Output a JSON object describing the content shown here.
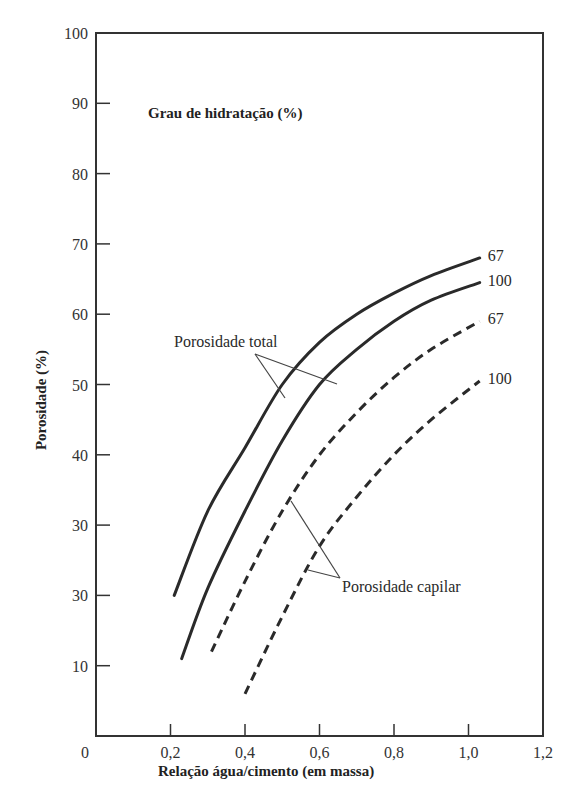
{
  "chart_data": {
    "type": "line",
    "title": "Grau de hidratação (%)",
    "xlabel": "Relação água/cimento (em massa)",
    "ylabel": "Porosidade (%)",
    "xlim": [
      0,
      1.2
    ],
    "ylim": [
      0,
      100
    ],
    "x_ticks": [
      0.2,
      0.4,
      0.6,
      0.8,
      1.0,
      1.2
    ],
    "x_tick_labels": [
      "0",
      "0,2",
      "0,4",
      "0,6",
      "0,8",
      "1,0",
      "1,2"
    ],
    "y_ticks": [
      10,
      20,
      30,
      40,
      50,
      60,
      70,
      80,
      90,
      100
    ],
    "y_tick_labels": [
      "10",
      "30",
      "30",
      "40",
      "50",
      "60",
      "70",
      "80",
      "90",
      "100"
    ],
    "grid": false,
    "series": [
      {
        "name": "Porosidade total - 67% hidratação",
        "group": "Porosidade total",
        "end_label": "67",
        "style": "solid",
        "x": [
          0.21,
          0.3,
          0.4,
          0.5,
          0.6,
          0.7,
          0.8,
          0.9,
          1.03
        ],
        "y": [
          20,
          32,
          41,
          50,
          56,
          60,
          63,
          65.5,
          68
        ]
      },
      {
        "name": "Porosidade total - 100% hidratação",
        "group": "Porosidade total",
        "end_label": "100",
        "style": "solid",
        "x": [
          0.23,
          0.3,
          0.4,
          0.5,
          0.6,
          0.7,
          0.8,
          0.9,
          1.03
        ],
        "y": [
          11,
          21,
          32,
          42,
          50,
          55,
          59,
          62,
          64.5
        ]
      },
      {
        "name": "Porosidade capilar - 67% hidratação",
        "group": "Porosidade capilar",
        "end_label": "67",
        "style": "dashed",
        "x": [
          0.31,
          0.4,
          0.5,
          0.6,
          0.7,
          0.8,
          0.9,
          1.03
        ],
        "y": [
          12,
          22,
          32,
          40,
          46,
          51,
          55,
          59
        ]
      },
      {
        "name": "Porosidade capilar - 100% hidratação",
        "group": "Porosidade capilar",
        "end_label": "100",
        "style": "dashed",
        "x": [
          0.4,
          0.5,
          0.6,
          0.7,
          0.8,
          0.9,
          1.03
        ],
        "y": [
          6,
          17,
          27,
          34,
          40,
          45,
          50.5
        ]
      }
    ],
    "annotations": [
      {
        "text": "Porosidade total",
        "points_to": [
          "Porosidade total - 67% hidratação",
          "Porosidade total - 100% hidratação"
        ]
      },
      {
        "text": "Porosidade capilar",
        "points_to": [
          "Porosidade capilar - 67% hidratação",
          "Porosidade capilar - 100% hidratação"
        ]
      }
    ]
  },
  "labels": {
    "title": "Grau de hidratação (%)",
    "xlabel": "Relação água/cimento (em massa)",
    "ylabel": "Porosidade (%)",
    "annot_total": "Porosidade total",
    "annot_capillary": "Porosidade capilar",
    "origin": "0"
  },
  "colors": {
    "line": "#2a2a2a",
    "axis": "#333333",
    "background": "#ffffff"
  }
}
